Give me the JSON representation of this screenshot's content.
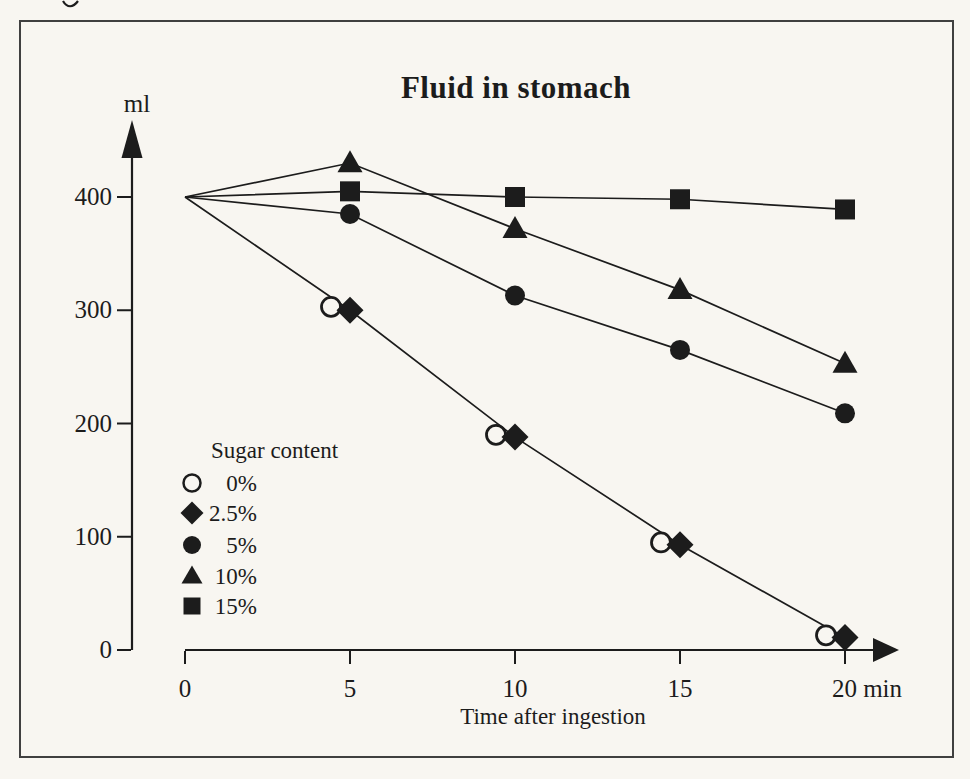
{
  "page": {
    "paper_color": "#f8f6f1",
    "ink_color": "#1c1c1c",
    "frame_color": "#404040"
  },
  "chart_data": {
    "type": "line",
    "title": "Fluid in stomach",
    "y_axis_unit": "ml",
    "x_axis_title": "Time after ingestion",
    "x_unit": "min",
    "x": [
      0,
      5,
      10,
      15,
      20
    ],
    "x_tick_labels": [
      "0",
      "5",
      "10",
      "15",
      "20 min"
    ],
    "y_ticks": [
      0,
      100,
      200,
      300,
      400
    ],
    "y_tick_labels": [
      "0",
      "100",
      "200",
      "300",
      "400"
    ],
    "xlim": [
      0,
      21.5
    ],
    "ylim": [
      0,
      455
    ],
    "grid": false,
    "legend": {
      "title": "Sugar content",
      "position": "inside-lower-left"
    },
    "series": [
      {
        "name": "0%",
        "marker": "open-circle",
        "line_visible": false,
        "values": [
          400,
          303,
          190,
          95,
          13
        ]
      },
      {
        "name": "2.5%",
        "marker": "diamond",
        "line_visible": true,
        "values": [
          400,
          300,
          188,
          93,
          11
        ]
      },
      {
        "name": "5%",
        "marker": "circle",
        "line_visible": true,
        "values": [
          400,
          385,
          313,
          265,
          209
        ]
      },
      {
        "name": "10%",
        "marker": "triangle",
        "line_visible": true,
        "values": [
          400,
          430,
          372,
          318,
          253
        ]
      },
      {
        "name": "15%",
        "marker": "square",
        "line_visible": true,
        "values": [
          400,
          405,
          400,
          398,
          389
        ]
      }
    ]
  }
}
